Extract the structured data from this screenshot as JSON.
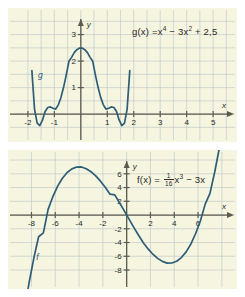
{
  "figure": {
    "background_color": "#ffffff",
    "panel_color": "#f6f5df",
    "grid_color": "#b9c4c9",
    "axis_color": "#5b5b4e",
    "curve_color": "#2e5d78",
    "label_color": "#2a2a2a"
  },
  "chart_data": [
    {
      "id": "top",
      "type": "line",
      "title": "",
      "function_label": "g",
      "formula_text": "g(x) = x⁴ − 3x² + 2,5",
      "formula_parts": {
        "name": "g(x) =",
        "term1_base": "x",
        "term1_exp": "4",
        "op1": "−",
        "term2_coef": "3x",
        "term2_exp": "2",
        "op2": "+",
        "term3": "2,5"
      },
      "expression": "x^4 - 3x^2 + 2.5",
      "xlabel": "x",
      "ylabel": "y",
      "xlim": [
        -2.45,
        5.6
      ],
      "ylim": [
        -0.75,
        3.7
      ],
      "xticks": [
        -2,
        -1,
        1,
        2,
        3,
        4,
        5
      ],
      "xtick_labels": [
        "-2",
        "-1",
        "1",
        "2",
        "3",
        "4",
        "5"
      ],
      "yticks": [
        1,
        2,
        3
      ],
      "ytick_labels": [
        "1",
        "2",
        "3"
      ],
      "grid": true,
      "grid_step_x": 0.5,
      "grid_step_y": 0.5,
      "curve_label": "g",
      "curve_label_at": [
        -1.62,
        1.35
      ],
      "key_points": {
        "local_maximum": [
          0,
          2.5
        ],
        "local_minima": [
          [
            -1.2247,
            0.25
          ],
          [
            1.2247,
            0.25
          ]
        ],
        "roots": [
          -1.4142,
          -0.4472,
          0.4472,
          1.4142
        ]
      },
      "x": [
        -1.85,
        -1.75,
        -1.65,
        -1.55,
        -1.45,
        -1.35,
        -1.25,
        -1.15,
        -1.05,
        -0.95,
        -0.85,
        -0.75,
        -0.65,
        -0.55,
        -0.45,
        -0.35,
        -0.25,
        -0.15,
        -0.05,
        0.05,
        0.15,
        0.25,
        0.35,
        0.45,
        0.55,
        0.65,
        0.75,
        0.85,
        0.95,
        1.05,
        1.15,
        1.25,
        1.35,
        1.45,
        1.55,
        1.65,
        1.75,
        1.85
      ],
      "y": [
        1.64,
        0.19,
        -0.34,
        -0.43,
        -0.23,
        0.1,
        0.25,
        0.27,
        0.22,
        0.19,
        0.35,
        0.63,
        1.02,
        1.48,
        1.99,
        2.14,
        2.32,
        2.43,
        2.49,
        2.49,
        2.43,
        2.32,
        2.14,
        1.99,
        1.48,
        1.02,
        0.63,
        0.35,
        0.19,
        0.22,
        0.27,
        0.25,
        0.1,
        -0.23,
        -0.43,
        -0.34,
        0.19,
        1.64
      ]
    },
    {
      "id": "bottom",
      "type": "line",
      "title": "",
      "function_label": "f",
      "formula_text": "f(x) = 1/16 x³ − 3x",
      "formula_parts": {
        "name": "f(x) =",
        "frac_num": "1",
        "frac_den": "16",
        "term_base": "x",
        "term_exp": "3",
        "op": "−",
        "term2": "3x"
      },
      "expression": "(1/16)x^3 - 3x",
      "xlabel": "x",
      "ylabel": "y",
      "xlim": [
        -9.3,
        8.6
      ],
      "ylim": [
        -9.6,
        8.3
      ],
      "xticks": [
        -8,
        -6,
        -4,
        -2,
        2,
        4,
        6
      ],
      "xtick_labels": [
        "-8",
        "-6",
        "-4",
        "-2",
        "2",
        "4",
        "6"
      ],
      "yticks": [
        6,
        4,
        2,
        -2,
        -4,
        -6,
        -8
      ],
      "ytick_labels": [
        "6",
        "4",
        "2",
        "-2",
        "-4",
        "-6",
        "-8"
      ],
      "grid": true,
      "grid_step_x": 2,
      "grid_step_y": 2,
      "curve_label": "f",
      "curve_label_at": [
        -7.6,
        -6.6
      ],
      "key_points": {
        "local_maximum": [
          -4.0,
          8.0
        ],
        "local_minimum": [
          4.0,
          -8.0
        ],
        "roots": [
          -6.928,
          0,
          6.928
        ]
      },
      "x": [
        -8.6,
        -8.2,
        -7.8,
        -7.4,
        -7.0,
        -6.6,
        -6.2,
        -5.8,
        -5.4,
        -5.0,
        -4.6,
        -4.2,
        -3.8,
        -3.4,
        -3.0,
        -2.6,
        -2.2,
        -1.8,
        -1.4,
        -1.0,
        -0.6,
        -0.2,
        0.2,
        0.6,
        1.0,
        1.4,
        1.8,
        2.2,
        2.6,
        3.0,
        3.4,
        3.8,
        4.2,
        4.6,
        5.0,
        5.4,
        5.8,
        6.2,
        6.6,
        7.0,
        7.4,
        7.8,
        8.2
      ],
      "y": [
        -13.97,
        -9.85,
        -6.26,
        -3.16,
        -2.59,
        0.83,
        2.69,
        4.21,
        5.36,
        6.19,
        6.72,
        6.98,
        7.0,
        6.74,
        6.31,
        5.7,
        4.93,
        4.03,
        3.03,
        2.94,
        1.79,
        0.6,
        -0.6,
        -1.79,
        -2.94,
        -4.03,
        -4.93,
        -5.7,
        -6.31,
        -6.74,
        -7.0,
        -6.98,
        -6.72,
        -6.19,
        -5.36,
        -4.21,
        -2.69,
        -0.83,
        1.59,
        3.16,
        6.26,
        9.85,
        13.97
      ]
    }
  ]
}
